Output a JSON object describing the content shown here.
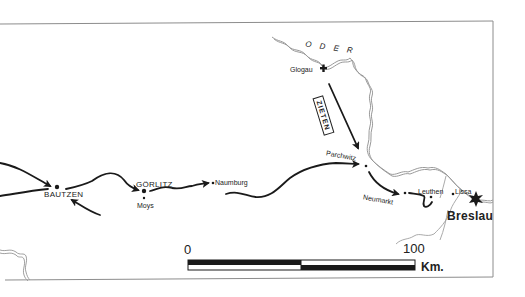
{
  "map": {
    "subject": "Prussian march routes in Silesia",
    "colors": {
      "background": "#ffffff",
      "route": "#1a1a1a",
      "river": "#9a9a9a",
      "border": "#8c8c8c"
    },
    "rivers": [
      {
        "name": "ODER",
        "label": "O D E R"
      }
    ],
    "places": {
      "bautzen": "BAUTZEN",
      "gorlitz": "GÖRLITZ",
      "moys": "Moys",
      "naumburg": "Naumburg",
      "glogau": "Glogau",
      "parchwitz": "Parchwitz",
      "neumarkt": "Neumarkt",
      "leuthen": "Leuthen",
      "lissa": "Lissa",
      "breslau": "Breslau"
    },
    "units": {
      "zieten": "ZIETEN"
    },
    "icons": {
      "fortress": "fortress-cross-icon",
      "city": "city-star-icon",
      "town": "town-dot-icon",
      "arrow": "march-arrow-icon"
    },
    "scale_bar": {
      "start_label": "0",
      "end_label": "100",
      "unit_label": "Km."
    }
  }
}
